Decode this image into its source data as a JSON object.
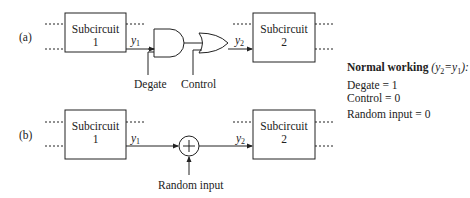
{
  "panel_a": {
    "label": "(a)",
    "block1": {
      "title": "Subcircuit",
      "num": "1"
    },
    "block2": {
      "title": "Subcircuit",
      "num": "2"
    },
    "signal_in": {
      "name": "y",
      "sub": "1"
    },
    "signal_out": {
      "name": "y",
      "sub": "2"
    },
    "gate1": "AND",
    "gate2": "OR",
    "input_degate": "Degate",
    "input_control": "Control"
  },
  "panel_b": {
    "label": "(b)",
    "block1": {
      "title": "Subcircuit",
      "num": "1"
    },
    "block2": {
      "title": "Subcircuit",
      "num": "2"
    },
    "signal_in": {
      "name": "y",
      "sub": "1"
    },
    "signal_out": {
      "name": "y",
      "sub": "2"
    },
    "operator": "XOR (+)",
    "input_random": "Random input"
  },
  "notes": {
    "heading": "Normal working",
    "condition": "(y2=y1):",
    "lines": [
      "Degate = 1",
      "Control = 0",
      "Random input = 0"
    ]
  }
}
